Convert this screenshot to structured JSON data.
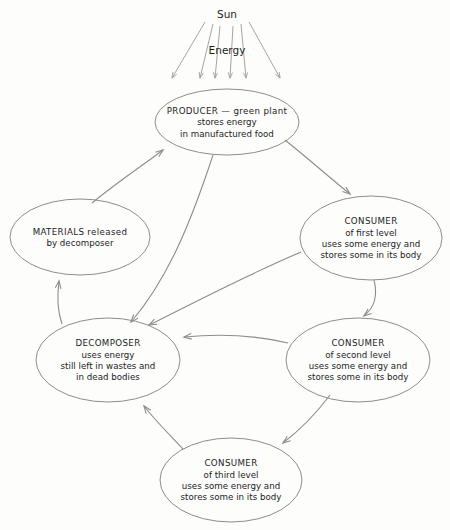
{
  "diagram": {
    "stroke_color": "#8d8d8d",
    "text_color": "#1c1c1c",
    "background_color": "#fdfdfc",
    "labels": {
      "sun": "Sun",
      "energy": "Energy"
    },
    "nodes": [
      {
        "id": "producer",
        "name": "producer-node",
        "cx": 227,
        "cy": 122,
        "rx": 72,
        "ry": 33,
        "lines": [
          "PRODUCER — green plant",
          "stores energy",
          "in manufactured food"
        ]
      },
      {
        "id": "materials",
        "name": "materials-node",
        "cx": 80,
        "cy": 237,
        "rx": 70,
        "ry": 38,
        "lines": [
          "MATERIALS  released",
          "by decomposer"
        ]
      },
      {
        "id": "consumer-first",
        "name": "consumer-first-level-node",
        "cx": 371,
        "cy": 238,
        "rx": 71,
        "ry": 42,
        "lines": [
          "CONSUMER",
          "of first level",
          "uses some energy  and",
          "stores some in its body"
        ]
      },
      {
        "id": "decomposer",
        "name": "decomposer-node",
        "cx": 108,
        "cy": 360,
        "rx": 72,
        "ry": 42,
        "lines": [
          "DECOMPOSER",
          "uses energy",
          "still left in wastes and",
          "in dead bodies"
        ]
      },
      {
        "id": "consumer-second",
        "name": "consumer-second-level-node",
        "cx": 358,
        "cy": 360,
        "rx": 72,
        "ry": 42,
        "lines": [
          "CONSUMER",
          "of second level",
          "uses some energy  and",
          "stores some in its body"
        ]
      },
      {
        "id": "consumer-third",
        "name": "consumer-third-level-node",
        "cx": 231,
        "cy": 480,
        "rx": 71,
        "ry": 42,
        "lines": [
          "CONSUMER",
          "of third level",
          "uses some energy  and",
          "stores some in its body"
        ]
      }
    ],
    "sun_rays": [
      {
        "x1": 205,
        "y1": 22,
        "x2": 172,
        "y2": 78
      },
      {
        "x1": 213,
        "y1": 24,
        "x2": 200,
        "y2": 78
      },
      {
        "x1": 220,
        "y1": 26,
        "x2": 215,
        "y2": 78
      },
      {
        "x1": 233,
        "y1": 26,
        "x2": 230,
        "y2": 78
      },
      {
        "x1": 241,
        "y1": 24,
        "x2": 246,
        "y2": 78
      },
      {
        "x1": 249,
        "y1": 22,
        "x2": 280,
        "y2": 78
      }
    ],
    "flows": [
      {
        "id": "materials-to-producer",
        "name": "flow-materials-to-producer",
        "from": "materials",
        "to": "producer",
        "path": "M 92,203 C 120,180 142,166 163,150"
      },
      {
        "id": "producer-to-consumer-first",
        "name": "flow-producer-to-consumer-first",
        "from": "producer",
        "to": "consumer-first",
        "path": "M 285,140 C 310,160 330,178 350,194"
      },
      {
        "id": "producer-to-decomposer",
        "name": "flow-producer-to-decomposer",
        "from": "producer",
        "to": "decomposer",
        "path": "M 213,155 C 190,225 167,280 131,322"
      },
      {
        "id": "consumer-first-to-decomposer",
        "name": "flow-consumer-first-to-decomposer",
        "from": "consumer-first",
        "to": "decomposer",
        "path": "M 301,252 C 240,278 190,305 149,325"
      },
      {
        "id": "consumer-first-to-consumer-second",
        "name": "flow-consumer-first-to-consumer-second",
        "from": "consumer-first",
        "to": "consumer-second",
        "path": "M 374,280 C 378,296 374,308 364,316"
      },
      {
        "id": "consumer-second-to-decomposer",
        "name": "flow-consumer-second-to-decomposer",
        "from": "consumer-second",
        "to": "decomposer",
        "path": "M 288,343 C 250,334 215,334 184,337"
      },
      {
        "id": "consumer-second-to-consumer-third",
        "name": "flow-consumer-second-to-consumer-third",
        "from": "consumer-second",
        "to": "consumer-third",
        "path": "M 330,395 C 315,415 300,430 283,443"
      },
      {
        "id": "consumer-third-to-decomposer",
        "name": "flow-consumer-third-to-decomposer",
        "from": "consumer-third",
        "to": "decomposer",
        "path": "M 183,449 C 167,432 153,418 144,406"
      },
      {
        "id": "decomposer-to-materials",
        "name": "flow-decomposer-to-materials",
        "from": "decomposer",
        "to": "materials",
        "path": "M 62,324 C 57,310 57,296 59,281"
      }
    ]
  }
}
